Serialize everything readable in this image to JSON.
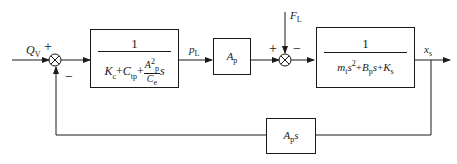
{
  "diagram": {
    "type": "block-diagram",
    "signals": {
      "input": {
        "symbol": "Q",
        "sub": "V"
      },
      "intermediate": {
        "symbol": "p",
        "sub": "L"
      },
      "disturbance": {
        "symbol": "F",
        "sub": "L"
      },
      "output": {
        "symbol": "x",
        "sub": "s"
      }
    },
    "summing_junctions": [
      {
        "id": "sum1",
        "signs": {
          "input": "+",
          "feedback": "−"
        }
      },
      {
        "id": "sum2",
        "signs": {
          "input": "+",
          "disturbance": "−"
        }
      }
    ],
    "blocks": {
      "flow_block": {
        "numerator": "1",
        "denominator": {
          "t1": "K",
          "t1_sub": "c",
          "plus1": "+",
          "t2": "C",
          "t2_sub": "tp",
          "plus2": "+",
          "frac_num": "A",
          "frac_num_sub": "p",
          "frac_num_sup": "2",
          "frac_den": "C",
          "frac_den_sub": "e",
          "s": "s"
        }
      },
      "area_block": {
        "symbol": "A",
        "sub": "p"
      },
      "load_block": {
        "numerator": "1",
        "denominator": {
          "m": "m",
          "m_sub": "t",
          "s2": "s",
          "s2_sup": "2",
          "plus1": "+",
          "b": "B",
          "b_sub": "p",
          "s1": "s",
          "plus2": "+",
          "k": "K",
          "k_sub": "s"
        }
      },
      "feedback_block": {
        "symbol": "A",
        "sub": "p",
        "s": "s"
      }
    }
  }
}
